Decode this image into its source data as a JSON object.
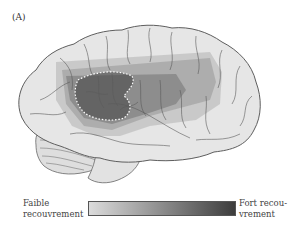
{
  "figure": {
    "panel_label": "(A)",
    "colors": {
      "brain_fill": "#e6e6e6",
      "brain_outline": "#6a6a6a",
      "overlap_low": "#c4c4c4",
      "overlap_mid": "#9a9a9a",
      "overlap_high": "#5a5a5a",
      "dotted_outline": "#ffffff"
    }
  },
  "legend": {
    "low_label_line1": "Faible",
    "low_label_line2": "recouvrement",
    "high_label_line1": "Fort recou-",
    "high_label_line2": "vrement",
    "gradient_start": "#dcdcdc",
    "gradient_end": "#3c3c3c"
  }
}
